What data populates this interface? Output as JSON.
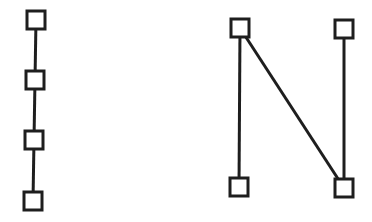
{
  "diagram": {
    "type": "graph",
    "colors": {
      "stroke": "#1e1e1e",
      "node_fill": "#ffffff",
      "background": "#ffffff"
    },
    "graphs": [
      {
        "name": "path-graph",
        "description": "4 nodes connected in a vertical chain",
        "nodes": [
          "p1",
          "p2",
          "p3",
          "p4"
        ],
        "edges": [
          [
            "p1",
            "p2"
          ],
          [
            "p2",
            "p3"
          ],
          [
            "p3",
            "p4"
          ]
        ]
      },
      {
        "name": "n-shaped-graph",
        "description": "4 nodes connected in an N shape",
        "nodes": [
          "a",
          "b",
          "c",
          "d"
        ],
        "edges": [
          [
            "a",
            "c"
          ],
          [
            "a",
            "d"
          ],
          [
            "b",
            "d"
          ]
        ]
      }
    ]
  }
}
